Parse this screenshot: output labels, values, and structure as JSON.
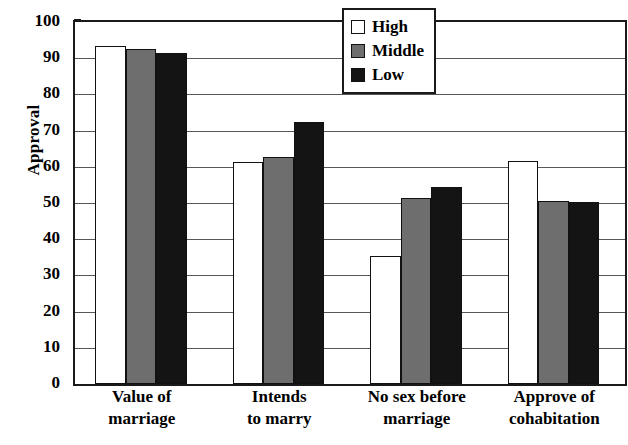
{
  "chart_data": {
    "type": "bar",
    "title": "",
    "xlabel": "",
    "ylabel": "Approval",
    "ylim": [
      0,
      100
    ],
    "ytick_step": 10,
    "yticks": [
      0,
      10,
      20,
      30,
      40,
      50,
      60,
      70,
      80,
      90,
      100
    ],
    "grid": true,
    "legend_position": "top-right",
    "categories": [
      "Value of marriage",
      "Intends to marry",
      "No sex before marriage",
      "Approve of cohabitation"
    ],
    "category_lines": [
      [
        "Value of",
        "marriage"
      ],
      [
        "Intends",
        "to marry"
      ],
      [
        "No sex before",
        "marriage"
      ],
      [
        "Approve of",
        "cohabitation"
      ]
    ],
    "series": [
      {
        "name": "High",
        "color": "#ffffff",
        "values": [
          93.5,
          61.4,
          35.4,
          61.6
        ]
      },
      {
        "name": "Middle",
        "color": "#6e6e6e",
        "values": [
          92.5,
          62.6,
          51.4,
          50.5
        ]
      },
      {
        "name": "Low",
        "color": "#141414",
        "values": [
          91.4,
          72.3,
          54.4,
          50.3
        ]
      }
    ]
  },
  "legend": {
    "items": [
      {
        "label": "High"
      },
      {
        "label": "Middle"
      },
      {
        "label": "Low"
      }
    ]
  }
}
